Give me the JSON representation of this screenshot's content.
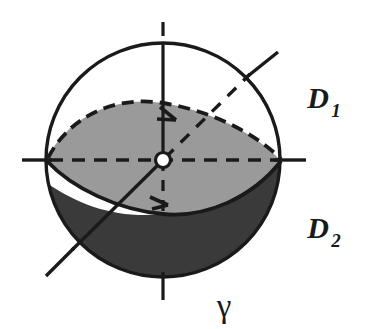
{
  "figure": {
    "background_color": "#ffffff",
    "stroke_color": "#1a1a1a",
    "geometry": {
      "center_x": 163,
      "center_y": 160,
      "radius": 117,
      "axis_overhang": 22,
      "stroke_width": 3.2
    },
    "regions": [
      {
        "name": "upper-lens-region",
        "label": "D1",
        "fill_color": "#9a9a9a",
        "description": "light gray lens-shaped region above the curve gamma"
      },
      {
        "name": "lower-cap-region",
        "label": "D2",
        "fill_color": "#3a3a3a",
        "description": "dark gray region below the curve gamma"
      }
    ],
    "labels": [
      {
        "name": "label-d1",
        "base": "D",
        "subscript": "1",
        "x": 318,
        "y": 108
      },
      {
        "name": "label-d2",
        "base": "D",
        "subscript": "2",
        "x": 318,
        "y": 238
      },
      {
        "name": "label-gamma",
        "text": "γ",
        "x": 224,
        "y": 315
      }
    ],
    "elements": {
      "sphere_outline": "sphere-outline",
      "equator_dashed": "equator-dashed-line",
      "vertical_axis": "vertical-axis",
      "horizontal_axis": "horizontal-axis",
      "diagonal_axis": "diagonal-axis",
      "center_point": "center-point-circle",
      "gamma_curve": "gamma-curve",
      "lens_top_dashed": "lens-top-dashed-arc"
    }
  }
}
